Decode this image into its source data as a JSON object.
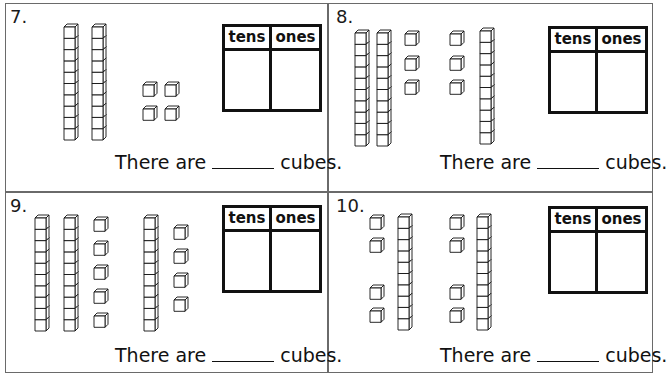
{
  "worksheet": {
    "panels": [
      {
        "number": "7.",
        "table": {
          "headers": [
            "tens",
            "ones"
          ]
        },
        "sentence": {
          "prefix": "There are",
          "suffix": "cubes."
        },
        "blocks": {
          "rods": [
            [
              64,
              24
            ],
            [
              92,
              24
            ]
          ],
          "units": [
            [
              143,
              82
            ],
            [
              165,
              82
            ],
            [
              143,
              106
            ],
            [
              165,
              106
            ]
          ]
        },
        "counts": {
          "tens_rods": 2,
          "unit_cubes": 4
        }
      },
      {
        "number": "8.",
        "table": {
          "headers": [
            "tens",
            "ones"
          ]
        },
        "sentence": {
          "prefix": "There are",
          "suffix": "cubes."
        },
        "blocks": {
          "rods": [
            [
              355,
              30
            ],
            [
              377,
              30
            ],
            [
              480,
              28
            ]
          ],
          "units": [
            [
              405,
              31
            ],
            [
              405,
              56
            ],
            [
              405,
              80
            ],
            [
              450,
              31
            ],
            [
              450,
              56
            ],
            [
              450,
              80
            ]
          ]
        },
        "counts": {
          "tens_rods": 3,
          "unit_cubes": 6
        }
      },
      {
        "number": "9.",
        "table": {
          "headers": [
            "tens",
            "ones"
          ]
        },
        "sentence": {
          "prefix": "There are",
          "suffix": "cubes."
        },
        "blocks": {
          "rods": [
            [
              35,
              215
            ],
            [
              64,
              215
            ],
            [
              144,
              215
            ]
          ],
          "units": [
            [
              94,
              217
            ],
            [
              94,
              241
            ],
            [
              94,
              265
            ],
            [
              94,
              289
            ],
            [
              94,
              313
            ],
            [
              174,
              225
            ],
            [
              174,
              249
            ],
            [
              174,
              273
            ],
            [
              174,
              297
            ]
          ]
        },
        "counts": {
          "tens_rods": 3,
          "unit_cubes": 9
        }
      },
      {
        "number": "10.",
        "table": {
          "headers": [
            "tens",
            "ones"
          ]
        },
        "sentence": {
          "prefix": "There are",
          "suffix": "cubes."
        },
        "blocks": {
          "rods": [
            [
              398,
              214
            ],
            [
              477,
              214
            ]
          ],
          "units": [
            [
              370,
              215
            ],
            [
              370,
              238
            ],
            [
              370,
              285
            ],
            [
              370,
              308
            ],
            [
              450,
              215
            ],
            [
              450,
              238
            ],
            [
              450,
              285
            ],
            [
              450,
              308
            ]
          ]
        },
        "counts": {
          "tens_rods": 2,
          "unit_cubes": 8
        }
      }
    ]
  },
  "colors": {
    "line": "#111111",
    "border": "#6a6a6a",
    "background": "#ffffff"
  }
}
